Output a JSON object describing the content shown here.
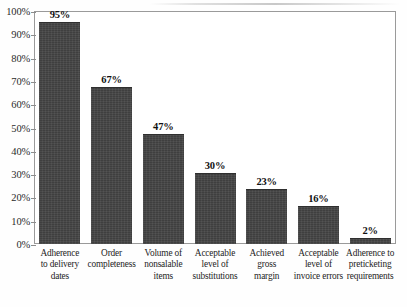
{
  "chart_data": {
    "type": "bar",
    "title": "",
    "subtitle": "",
    "xlabel": "",
    "ylabel": "",
    "ylim": [
      0,
      100
    ],
    "grid": false,
    "legend": null,
    "legend_position": "none",
    "y_ticks": [
      "0%",
      "10%",
      "20%",
      "30%",
      "40%",
      "50%",
      "60%",
      "70%",
      "80%",
      "90%",
      "100%"
    ],
    "y_tick_values": [
      0,
      10,
      20,
      30,
      40,
      50,
      60,
      70,
      80,
      90,
      100
    ],
    "categories": [
      "Adherence\nto delivery\ndates",
      "Order\ncompleteness",
      "Volume of\nnonsalable\nitems",
      "Acceptable\nlevel of\nsubstitutions",
      "Achieved\ngross\nmargin",
      "Acceptable\nlevel of\ninvoice errors",
      "Adherence to\npreticketing\nrequirements"
    ],
    "values": [
      95,
      67,
      47,
      30,
      23,
      16,
      2
    ],
    "data_labels": [
      "95%",
      "67%",
      "47%",
      "30%",
      "23%",
      "16%",
      "2%"
    ],
    "bar_color": "#3f3f3f",
    "frame_color": "#9a9a9a",
    "background_color": "#ffffff"
  }
}
